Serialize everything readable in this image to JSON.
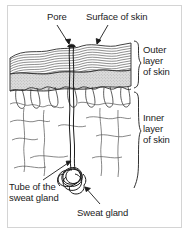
{
  "figure": {
    "type": "biology-diagram",
    "background_color": "#ffffff",
    "ink_color": "#1b1b1b",
    "epidermis_fill": "#d2d2d2",
    "border_color": "#cfcfcf"
  },
  "labels": {
    "pore": "Pore",
    "surface_of_skin": "Surface of skin",
    "outer_layer": "Outer\nlayer\nof skin",
    "inner_layer": "Inner\nlayer\nof skin",
    "tube_of_sweat_gland": "Tube of the\nsweat gland",
    "sweat_gland": "Sweat gland"
  },
  "brackets": [
    {
      "name": "outer-layer-bracket",
      "label": "Outer layer of skin",
      "top": 40,
      "bottom": 90
    },
    {
      "name": "inner-layer-bracket",
      "label": "Inner layer of skin",
      "top": 92,
      "bottom": 188
    }
  ],
  "structures": [
    {
      "name": "skin-surface",
      "label": "Surface of skin"
    },
    {
      "name": "pore",
      "label": "Pore"
    },
    {
      "name": "epidermis",
      "label": "Outer layer of skin"
    },
    {
      "name": "dermis",
      "label": "Inner layer of skin"
    },
    {
      "name": "sweat-duct",
      "label": "Tube of the sweat gland"
    },
    {
      "name": "sweat-gland-coil",
      "label": "Sweat gland"
    }
  ]
}
